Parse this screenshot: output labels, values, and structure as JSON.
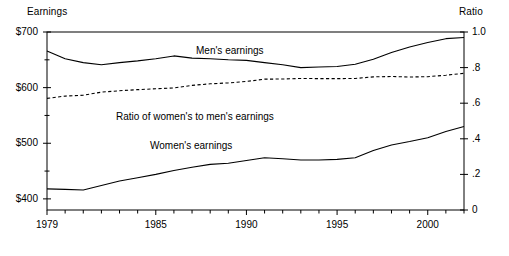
{
  "chart_data": {
    "type": "line",
    "title": "",
    "xlabel": "",
    "ylabel": "Earnings",
    "y2label": "Ratio",
    "grid": false,
    "legend": "inline-annotations",
    "x": [
      1979,
      1980,
      1981,
      1982,
      1983,
      1984,
      1985,
      1986,
      1987,
      1988,
      1989,
      1990,
      1991,
      1992,
      1993,
      1994,
      1995,
      1996,
      1997,
      1998,
      1999,
      2000,
      2001,
      2002
    ],
    "xlim": [
      1979,
      2002
    ],
    "ylim": [
      380,
      700
    ],
    "y2lim": [
      0,
      1.0
    ],
    "xticks": [
      1979,
      1985,
      1990,
      1995,
      2000
    ],
    "xtick_labels": [
      "1979",
      "1985",
      "1990",
      "1995",
      "2000"
    ],
    "xtick_minor_every": 1,
    "yticks": [
      400,
      500,
      600,
      700
    ],
    "ytick_labels": [
      "$400",
      "$500",
      "$600",
      "$700"
    ],
    "y2ticks": [
      0,
      0.2,
      0.4,
      0.6,
      0.8,
      1.0
    ],
    "y2tick_labels": [
      "0",
      ".2",
      ".4",
      ".6",
      ".8",
      "1.0"
    ],
    "series": [
      {
        "name": "Men's earnings",
        "axis": "left",
        "style": "solid",
        "label_text": "Men's earnings",
        "values": [
          666,
          652,
          645,
          641,
          645,
          648,
          652,
          657,
          653,
          652,
          650,
          649,
          645,
          641,
          636,
          637,
          638,
          642,
          651,
          663,
          673,
          681,
          688,
          690
        ]
      },
      {
        "name": "Women's earnings",
        "axis": "left",
        "style": "solid",
        "label_text": "Women's earnings",
        "values": [
          418,
          417,
          416,
          424,
          432,
          438,
          444,
          451,
          457,
          462,
          464,
          469,
          474,
          472,
          470,
          470,
          471,
          474,
          487,
          497,
          503,
          510,
          521,
          530
        ]
      },
      {
        "name": "Ratio of women's to men's earnings",
        "axis": "right",
        "style": "dashed",
        "label_text": "Ratio of women's to men's earnings",
        "values": [
          0.627,
          0.64,
          0.645,
          0.662,
          0.67,
          0.676,
          0.681,
          0.686,
          0.7,
          0.709,
          0.714,
          0.722,
          0.735,
          0.736,
          0.739,
          0.738,
          0.738,
          0.739,
          0.748,
          0.75,
          0.747,
          0.749,
          0.757,
          0.768
        ]
      }
    ],
    "annotations": [
      {
        "text": "Men's earnings",
        "x": 1989.6,
        "series": "Men's earnings"
      },
      {
        "text": "Ratio of women's to men's earnings",
        "x": 1986.5,
        "series": "Ratio of women's to men's earnings"
      },
      {
        "text": "Women's earnings",
        "x": 1988.5,
        "series": "Women's earnings"
      }
    ],
    "colors": {
      "line": "#000000",
      "frame": "#000000",
      "background": "#ffffff"
    }
  }
}
